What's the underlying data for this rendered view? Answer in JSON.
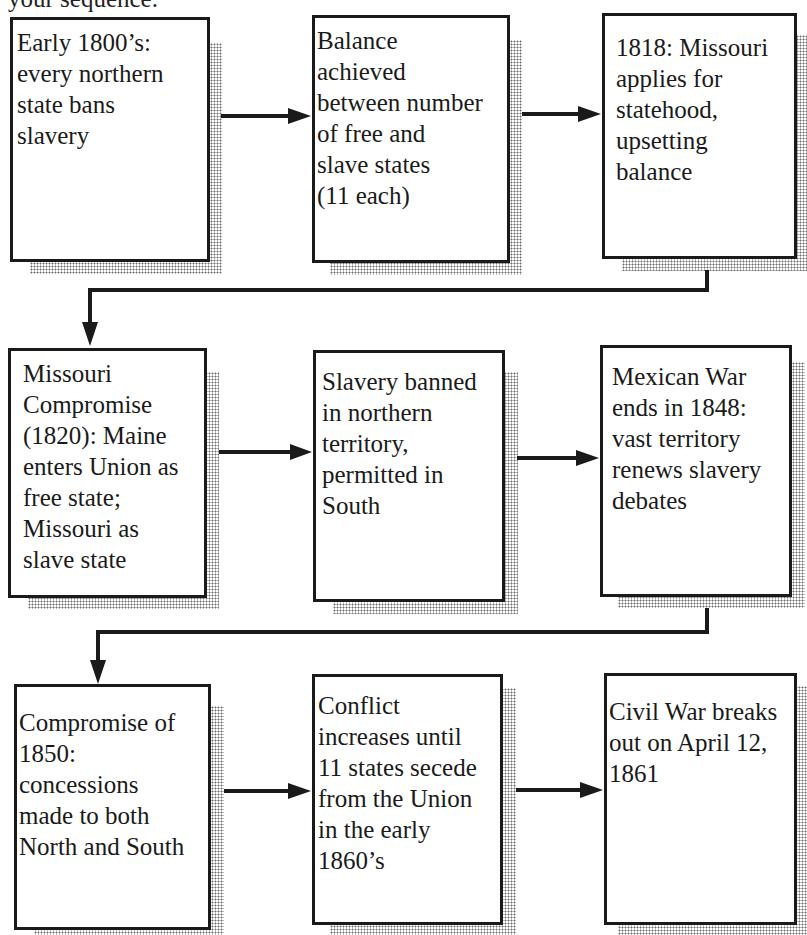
{
  "header": {
    "partial_text": "your sequence."
  },
  "flowchart": {
    "rows": [
      {
        "boxes": [
          {
            "id": 1,
            "text": "Early 1800’s:\nevery northern\nstate bans\nslavery"
          },
          {
            "id": 2,
            "text": "Balance\nachieved\nbetween number\nof free and\nslave states\n(11 each)"
          },
          {
            "id": 3,
            "text": "1818: Missouri\napplies for\nstatehood,\nupsetting\nbalance"
          }
        ]
      },
      {
        "boxes": [
          {
            "id": 4,
            "text": "Missouri\nCompromise\n(1820): Maine\nenters Union as\nfree state;\nMissouri as\nslave state"
          },
          {
            "id": 5,
            "text": "Slavery banned\nin northern\nterritory,\npermitted in\nSouth"
          },
          {
            "id": 6,
            "text": "Mexican War\nends in 1848:\nvast territory\nrenews slavery\ndebates"
          }
        ]
      },
      {
        "boxes": [
          {
            "id": 7,
            "text": "Compromise of\n1850:\nconcessions\nmade to both\nNorth and South"
          },
          {
            "id": 8,
            "text": "Conflict\nincreases until\n11 states secede\nfrom the Union\nin the early\n1860’s"
          },
          {
            "id": 9,
            "text": "Civil War breaks\nout on April 12,\n1861"
          }
        ]
      }
    ],
    "connections": [
      {
        "from": 1,
        "to": 2,
        "type": "horizontal-arrow"
      },
      {
        "from": 2,
        "to": 3,
        "type": "horizontal-arrow"
      },
      {
        "from": 3,
        "to": 4,
        "type": "elbow-return-arrow"
      },
      {
        "from": 4,
        "to": 5,
        "type": "horizontal-arrow"
      },
      {
        "from": 5,
        "to": 6,
        "type": "horizontal-arrow"
      },
      {
        "from": 6,
        "to": 7,
        "type": "elbow-return-arrow"
      },
      {
        "from": 7,
        "to": 8,
        "type": "horizontal-arrow"
      },
      {
        "from": 8,
        "to": 9,
        "type": "horizontal-arrow"
      }
    ],
    "colors": {
      "line": "#1a1a1a",
      "shadow_dots": "#6e6e6e",
      "background": "#ffffff"
    }
  }
}
